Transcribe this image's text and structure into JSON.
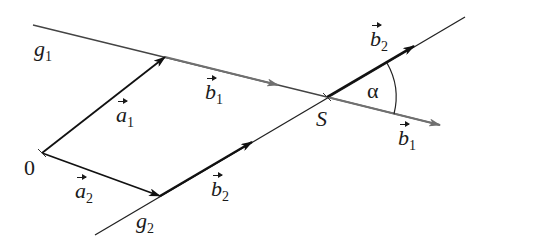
{
  "figure": {
    "lines": {
      "g1": {
        "label": "g",
        "sub": "1",
        "color": "#555555"
      },
      "g2": {
        "label": "g",
        "sub": "2",
        "color": "#222222"
      }
    },
    "points": {
      "origin": {
        "label": "0"
      },
      "intersection": {
        "label": "S"
      }
    },
    "vectors": {
      "a1": {
        "label": "a",
        "sub": "1"
      },
      "a2": {
        "label": "a",
        "sub": "2"
      },
      "b1_first": {
        "label": "b",
        "sub": "1"
      },
      "b1_second": {
        "label": "b",
        "sub": "1"
      },
      "b2_first": {
        "label": "b",
        "sub": "2"
      },
      "b2_second": {
        "label": "b",
        "sub": "2"
      }
    },
    "angle": {
      "label": "α"
    },
    "colors": {
      "black": "#111111",
      "gray": "#666666",
      "background": "#ffffff"
    }
  }
}
